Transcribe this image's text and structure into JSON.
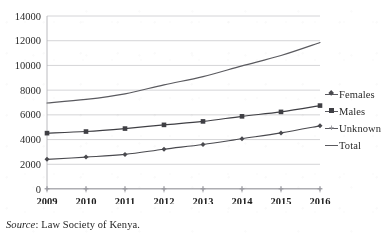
{
  "figure": {
    "cropped_title": "",
    "source_prefix": "Source",
    "source_separator": ": ",
    "source_text": "Law Society of Kenya."
  },
  "legend": {
    "position": "right",
    "items": [
      {
        "label": "Females",
        "marker": "diamond-marker",
        "color": "#4a4a4f"
      },
      {
        "label": "Males",
        "marker": "square-marker",
        "color": "#3f3f44"
      },
      {
        "label": "Unknown",
        "marker": "cross-marker",
        "color": "#9a9aa0"
      },
      {
        "label": "Total",
        "marker": "line-marker",
        "color": "#5a5a5f"
      }
    ]
  },
  "chart_data": {
    "type": "line",
    "title": "",
    "xlabel": "",
    "ylabel": "",
    "x": [
      2009,
      2010,
      2011,
      2012,
      2013,
      2014,
      2015,
      2016
    ],
    "categories": [
      "2009",
      "2010",
      "2011",
      "2012",
      "2013",
      "2014",
      "2015",
      "2016"
    ],
    "ylim": [
      0,
      14000
    ],
    "ytick_values": [
      0,
      2000,
      4000,
      6000,
      8000,
      10000,
      12000,
      14000
    ],
    "ytick_labels": [
      "0",
      "2000",
      "4000",
      "6000",
      "8000",
      "10000",
      "12000",
      "14000"
    ],
    "grid": "horizontal",
    "legend_position": "right",
    "series": [
      {
        "name": "Females",
        "marker": "diamond",
        "color": "#4a4a4f",
        "values": [
          2400,
          2580,
          2800,
          3220,
          3600,
          4070,
          4540,
          5110
        ]
      },
      {
        "name": "Males",
        "marker": "square",
        "color": "#3f3f44",
        "values": [
          4520,
          4650,
          4890,
          5190,
          5470,
          5880,
          6240,
          6750
        ]
      },
      {
        "name": "Unknown",
        "marker": "cross",
        "color": "#9a9aa0",
        "values": [
          20,
          20,
          20,
          20,
          20,
          20,
          20,
          20
        ]
      },
      {
        "name": "Total",
        "marker": "none",
        "color": "#5a5a5f",
        "values": [
          6960,
          7250,
          7700,
          8430,
          9090,
          9960,
          10800,
          11850
        ]
      }
    ]
  }
}
